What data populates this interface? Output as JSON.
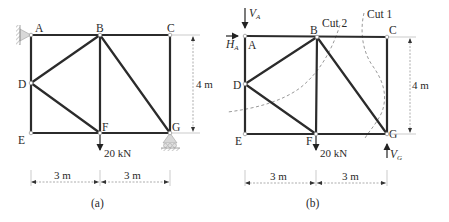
{
  "figures": [
    {
      "id": "a",
      "caption": "(a)",
      "nodes": {
        "A": {
          "label": "A",
          "x": 31,
          "y": 35
        },
        "B": {
          "label": "B",
          "x": 100,
          "y": 35
        },
        "C": {
          "label": "C",
          "x": 170,
          "y": 35
        },
        "D": {
          "label": "D",
          "x": 31,
          "y": 83
        },
        "E": {
          "label": "E",
          "x": 31,
          "y": 133
        },
        "F": {
          "label": "F",
          "x": 100,
          "y": 133
        },
        "G": {
          "label": "G",
          "x": 170,
          "y": 133
        }
      },
      "members": [
        "AB",
        "BC",
        "AD",
        "DE",
        "EF",
        "FG",
        "CG",
        "BD",
        "DF",
        "BF",
        "BG"
      ],
      "supports": {
        "A": "pin-wall",
        "G": "roller"
      },
      "load": {
        "node": "F",
        "label": "20 kN"
      },
      "dimensions": {
        "height": "4 m",
        "span1": "3 m",
        "span2": "3 m"
      }
    },
    {
      "id": "b",
      "caption": "(b)",
      "nodes": {
        "A": {
          "label": "A",
          "x": 246,
          "y": 36
        },
        "B": {
          "label": "B",
          "x": 317,
          "y": 37
        },
        "C": {
          "label": "C",
          "x": 388,
          "y": 37
        },
        "D": {
          "label": "D",
          "x": 245,
          "y": 84
        },
        "E": {
          "label": "E",
          "x": 245,
          "y": 134
        },
        "F": {
          "label": "F",
          "x": 316,
          "y": 134
        },
        "G": {
          "label": "G",
          "x": 387,
          "y": 134
        }
      },
      "members": [
        "AB",
        "BC",
        "AD",
        "DE",
        "EF",
        "FG",
        "CG",
        "BD",
        "DF",
        "BF",
        "BG"
      ],
      "reactions": {
        "VA": {
          "symbol": "V",
          "subscript": "A"
        },
        "HA": {
          "symbol": "H",
          "subscript": "A"
        },
        "VG": {
          "symbol": "V",
          "subscript": "G"
        }
      },
      "cuts": [
        {
          "label": "Cut 1"
        },
        {
          "label": "Cut 2"
        }
      ],
      "load": {
        "node": "F",
        "label": "20 kN"
      },
      "dimensions": {
        "height": "4 m",
        "span1": "3 m",
        "span2": "3 m"
      }
    }
  ]
}
